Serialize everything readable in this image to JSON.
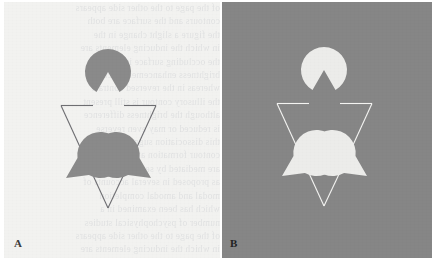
{
  "figure": {
    "background_color": "#ffffff",
    "width": 440,
    "height": 276
  },
  "panels": [
    {
      "id": "A",
      "label": "A",
      "label_color": "#3a3a3a",
      "background_color": "#f2f2f0",
      "inducer_color": "#8a8a8a",
      "contour_color": "#6e6e72",
      "polarity": "dark inducers on light background",
      "x": 4,
      "y": 2,
      "width": 216,
      "height": 256,
      "has_bleedthrough_text": true
    },
    {
      "id": "B",
      "label": "B",
      "label_color": "#222222",
      "background_color": "#868686",
      "inducer_color": "#ececea",
      "contour_color": "#f4f4f2",
      "polarity": "light inducers on mid-gray background",
      "x": 222,
      "y": 2,
      "width": 210,
      "height": 256,
      "has_bleedthrough_text": false
    }
  ],
  "stimulus": {
    "name": "kanizsa-triangle",
    "description": "Three pac-man inducer discs plus an outline triangle with interrupted contours producing an illusory triangle",
    "inducer_radius": 23,
    "wedge_angle_deg": 60,
    "inducers": [
      {
        "name": "inducer-top",
        "cx": 104,
        "cy": 70,
        "mouth_direction_deg": 90,
        "notch_points_toward": "down"
      },
      {
        "name": "inducer-bottom-left",
        "cx": 62,
        "cy": 176,
        "mouth_direction_deg": 330,
        "notch_points_toward": "upper-right"
      },
      {
        "name": "inducer-bottom-right",
        "cx": 147,
        "cy": 176,
        "mouth_direction_deg": 210,
        "notch_points_toward": "upper-left"
      }
    ],
    "outline_triangle": {
      "name": "outline-triangle",
      "orientation": "apex-down",
      "vertices": [
        [
          57,
          103
        ],
        [
          152,
          103
        ],
        [
          104,
          206
        ]
      ],
      "stroke_width": 1.1,
      "gaps": "contour interrupted where the illusory triangle edges cross"
    },
    "illusory_triangle": {
      "name": "illusory-triangle",
      "orientation": "apex-up",
      "vertices": [
        [
          104,
          70
        ],
        [
          62,
          176
        ],
        [
          147,
          176
        ]
      ],
      "visible": false
    }
  },
  "bleedthrough_text": {
    "note": "faint mirrored ghost text showing through the page from the reverse side",
    "lines": [
      "of the page to the other side appears",
      "contours and the surface are both",
      "the figure a slight change in the",
      "in which the inducing elements are",
      "the occluding surface is seen as",
      "brightness enhancement occurs",
      "whereas in the reversed contrast",
      "the illusory contour is still present",
      "although the brightness difference",
      "is reduced or may even reverse",
      "this dissociation suggests that",
      "contour formation and brightness",
      "are mediated by separate processes",
      "as proposed in several accounts of",
      "modal and amodal completion",
      "which has been examined in a",
      "number of psychophysical studies"
    ]
  }
}
